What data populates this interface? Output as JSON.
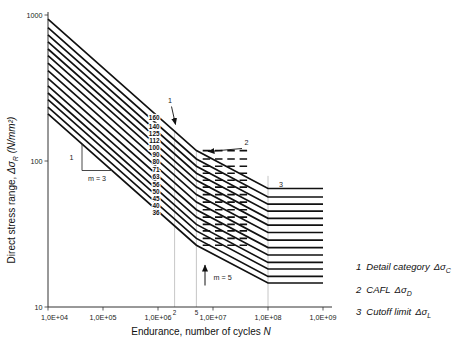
{
  "colors": {
    "line": "#111111",
    "grid": "#b8b8b8",
    "axis": "#333333",
    "text": "#222222",
    "background": "#ffffff"
  },
  "chart_data": {
    "type": "line",
    "x_scale": "log",
    "y_scale": "log",
    "xlim": [
      10000,
      1000000000
    ],
    "ylim": [
      10,
      1000
    ],
    "grid": "off",
    "legend_position": "right-bottom",
    "xlabel_text": "Endurance, number of cycles ",
    "xlabel_symbol": "N",
    "ylabel_text": "Direct stress range, ",
    "ylabel_symbol": "Δσ",
    "ylabel_symbol_sub": "R",
    "ylabel_unit": " (N/mm²)",
    "x_ticks": [
      {
        "label": "1,0E+04",
        "value": 10000
      },
      {
        "label": "1,0E+05",
        "value": 100000
      },
      {
        "label": "1,0E+06",
        "value": 1000000
      },
      {
        "label": "1,0E+07",
        "value": 10000000
      },
      {
        "label": "1,0E+08",
        "value": 100000000
      },
      {
        "label": "1,0E+09",
        "value": 1000000000
      }
    ],
    "x_minor_labels": [
      {
        "label": "2",
        "value": 2000000
      },
      {
        "label": "5",
        "value": 5000000
      }
    ],
    "y_ticks": [
      {
        "label": "10",
        "value": 10
      },
      {
        "label": "100",
        "value": 100
      },
      {
        "label": "1000",
        "value": 1000
      }
    ],
    "reference_lines": [
      {
        "value": 2000000,
        "top_sigma": 160
      },
      {
        "value": 5000000,
        "top_sigma": 118
      },
      {
        "value": 100000000,
        "top_sigma": 79
      }
    ],
    "detail_category_cycles": 2000000,
    "cafl_cycles": 5000000,
    "cutoff_cycles": 100000000,
    "slope_m1": 3,
    "slope_m2": 5,
    "slope_rise_label": "1",
    "slope_m1_label": "m = 3",
    "slope_m2_label": "m = 5",
    "cafl_dash_cycles": [
      6500000,
      45000000
    ],
    "series": [
      {
        "category": "160",
        "points": [
          [
            10000,
            935.7
          ],
          [
            5000000,
            117.9
          ],
          [
            100000000,
            64.8
          ],
          [
            1000000000,
            64.8
          ]
        ]
      },
      {
        "category": "140",
        "points": [
          [
            10000,
            818.7
          ],
          [
            5000000,
            103.2
          ],
          [
            100000000,
            56.7
          ],
          [
            1000000000,
            56.7
          ]
        ]
      },
      {
        "category": "125",
        "points": [
          [
            10000,
            731.0
          ],
          [
            5000000,
            92.1
          ],
          [
            100000000,
            50.6
          ],
          [
            1000000000,
            50.6
          ]
        ]
      },
      {
        "category": "112",
        "points": [
          [
            10000,
            655.0
          ],
          [
            5000000,
            82.5
          ],
          [
            100000000,
            45.3
          ],
          [
            1000000000,
            45.3
          ]
        ]
      },
      {
        "category": "100",
        "points": [
          [
            10000,
            584.8
          ],
          [
            5000000,
            73.7
          ],
          [
            100000000,
            40.5
          ],
          [
            1000000000,
            40.5
          ]
        ]
      },
      {
        "category": "90",
        "points": [
          [
            10000,
            526.3
          ],
          [
            5000000,
            66.3
          ],
          [
            100000000,
            36.4
          ],
          [
            1000000000,
            36.4
          ]
        ]
      },
      {
        "category": "80",
        "points": [
          [
            10000,
            467.8
          ],
          [
            5000000,
            58.9
          ],
          [
            100000000,
            32.4
          ],
          [
            1000000000,
            32.4
          ]
        ]
      },
      {
        "category": "71",
        "points": [
          [
            10000,
            415.2
          ],
          [
            5000000,
            52.3
          ],
          [
            100000000,
            28.7
          ],
          [
            1000000000,
            28.7
          ]
        ]
      },
      {
        "category": "63",
        "points": [
          [
            10000,
            368.4
          ],
          [
            5000000,
            46.4
          ],
          [
            100000000,
            25.5
          ],
          [
            1000000000,
            25.5
          ]
        ]
      },
      {
        "category": "56",
        "points": [
          [
            10000,
            327.5
          ],
          [
            5000000,
            41.3
          ],
          [
            100000000,
            22.7
          ],
          [
            1000000000,
            22.7
          ]
        ]
      },
      {
        "category": "50",
        "points": [
          [
            10000,
            292.4
          ],
          [
            5000000,
            36.8
          ],
          [
            100000000,
            20.2
          ],
          [
            1000000000,
            20.2
          ]
        ]
      },
      {
        "category": "45",
        "points": [
          [
            10000,
            263.2
          ],
          [
            5000000,
            33.2
          ],
          [
            100000000,
            18.2
          ],
          [
            1000000000,
            18.2
          ]
        ]
      },
      {
        "category": "40",
        "points": [
          [
            10000,
            233.9
          ],
          [
            5000000,
            29.5
          ],
          [
            100000000,
            16.2
          ],
          [
            1000000000,
            16.2
          ]
        ]
      },
      {
        "category": "36",
        "points": [
          [
            10000,
            210.5
          ],
          [
            5000000,
            26.5
          ],
          [
            100000000,
            14.6
          ],
          [
            1000000000,
            14.6
          ]
        ]
      }
    ]
  },
  "legend": {
    "items": [
      {
        "num": "1",
        "text": "Detail category",
        "symbol": "Δσ",
        "sub": "C"
      },
      {
        "num": "2",
        "text": "CAFL",
        "symbol": "Δσ",
        "sub": "D"
      },
      {
        "num": "3",
        "text": "Cutoff limit",
        "symbol": "Δσ",
        "sub": "L"
      }
    ]
  }
}
